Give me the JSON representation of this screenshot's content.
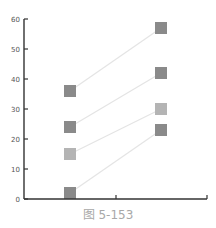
{
  "caption": "图 5-153",
  "chart_data": {
    "type": "line",
    "title": "",
    "xlabel": "",
    "ylabel": "",
    "x": [
      "A",
      "B"
    ],
    "x_tick_labels": [
      "",
      ""
    ],
    "ylim": [
      0,
      60
    ],
    "y_ticks": [
      0,
      10,
      20,
      30,
      40,
      50,
      60
    ],
    "grid": false,
    "legend": null,
    "marker": "square",
    "series": [
      {
        "name": "series-1",
        "values": [
          36,
          57
        ],
        "color": "#8a8a8a"
      },
      {
        "name": "series-2",
        "values": [
          24,
          42
        ],
        "color": "#8a8a8a"
      },
      {
        "name": "series-3",
        "values": [
          15,
          30
        ],
        "color": "#b4b4b4"
      },
      {
        "name": "series-4",
        "values": [
          2,
          23
        ],
        "color": "#8a8a8a"
      }
    ],
    "line_color": "#e4e4e4",
    "axis_color": "#333333"
  },
  "layout": {
    "plot_left": 24,
    "plot_right": 207,
    "y0_px": 199,
    "y60_px": 19,
    "x_positions_px": [
      70,
      161
    ],
    "x_ticks_px": [
      116,
      207
    ],
    "marker_size": 12
  }
}
